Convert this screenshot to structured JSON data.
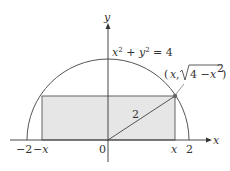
{
  "diagram": {
    "axes": {
      "x_label": "x",
      "y_label": "y"
    },
    "equation": {
      "lhs_x": "x",
      "exp1": "2",
      "plus": " + ",
      "lhs_y": "y",
      "exp2": "2",
      "rhs": " = 4"
    },
    "point_label": {
      "open": "(",
      "x": "x",
      "comma": ", ",
      "sqrt_arg_num": "4 − ",
      "sqrt_arg_var": "x",
      "sqrt_arg_exp": "2",
      "close": ")"
    },
    "radius_label": "2",
    "ticks": [
      {
        "label": "−2",
        "italic": false
      },
      {
        "label": "−x",
        "italic": true
      },
      {
        "label": "0",
        "italic": false
      },
      {
        "label": "x",
        "italic": true
      },
      {
        "label": "2",
        "italic": false
      }
    ],
    "colors": {
      "fill": "#e6e6e6",
      "stroke": "#555555",
      "point": "#666666"
    }
  }
}
